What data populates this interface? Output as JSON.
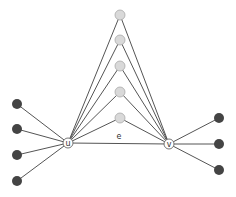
{
  "diagram": {
    "colors": {
      "edge": "#555555",
      "dark_node": "#444444",
      "light_node": "#d9d9d9",
      "light_node_stroke": "#aaaaaa",
      "labeled_node_fill": "#ffffff",
      "labeled_node_stroke": "#666666"
    },
    "labeled_nodes": [
      {
        "id": "u",
        "label": "u",
        "x": 68,
        "y": 143
      },
      {
        "id": "v",
        "label": "v",
        "x": 169,
        "y": 144
      }
    ],
    "top_nodes": [
      {
        "x": 120,
        "y": 15
      },
      {
        "x": 120,
        "y": 40
      },
      {
        "x": 120,
        "y": 66
      },
      {
        "x": 120,
        "y": 92
      },
      {
        "x": 120,
        "y": 118
      }
    ],
    "left_nodes": [
      {
        "x": 17,
        "y": 104
      },
      {
        "x": 17,
        "y": 129
      },
      {
        "x": 17,
        "y": 155
      },
      {
        "x": 17,
        "y": 181
      }
    ],
    "right_nodes": [
      {
        "x": 219,
        "y": 118
      },
      {
        "x": 219,
        "y": 144
      },
      {
        "x": 219,
        "y": 170
      }
    ],
    "edge_label": {
      "text": "e",
      "x": 119,
      "y": 139
    }
  }
}
